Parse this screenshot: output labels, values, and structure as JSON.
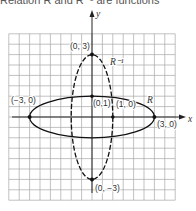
{
  "caption": {
    "text": "Relation R and R⁻¹ are functions"
  },
  "diagram": {
    "axes": {
      "x_label": "x",
      "y_label": "y"
    },
    "grid": {
      "cell_units": 0.5,
      "x_range": [
        -4,
        4
      ],
      "y_range": [
        -4,
        4
      ]
    },
    "curves": [
      {
        "name": "R",
        "label": "R",
        "equation": "x^2/9 + y^2 = 1",
        "style": "solid",
        "semi_axis_x": 3,
        "semi_axis_y": 1
      },
      {
        "name": "R_inverse",
        "label": "R⁻¹",
        "equation": "x^2 + y^2/9 = 1",
        "style": "dashed",
        "semi_axis_x": 1,
        "semi_axis_y": 3
      }
    ],
    "points": [
      {
        "label": "(0, 3)",
        "x": 0,
        "y": 3
      },
      {
        "label": "(−3, 0)",
        "x": -3,
        "y": 0
      },
      {
        "label": "(0,1)",
        "x": 0,
        "y": 1
      },
      {
        "label": "(1, 0)",
        "x": 1,
        "y": 0
      },
      {
        "label": "(3, 0)",
        "x": 3,
        "y": 0
      },
      {
        "label": "(0, −3)",
        "x": 0,
        "y": -3
      }
    ],
    "colors": {
      "grid": "#9a9a9a",
      "curve": "#111111",
      "text": "#333333"
    }
  }
}
